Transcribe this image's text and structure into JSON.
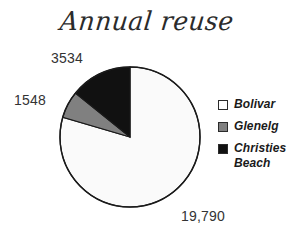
{
  "chart_data": {
    "type": "pie",
    "title": "Annual reuse",
    "xlabel": "",
    "ylabel": "",
    "legend_position": "right",
    "grid": false,
    "total": 24872,
    "categories": [
      "Bolivar",
      "Glenelg",
      "Christies Beach"
    ],
    "values": [
      19790,
      1548,
      3534
    ],
    "value_labels": [
      "19,790",
      "1548",
      "3534"
    ],
    "colors": [
      "#fafafa",
      "#808080",
      "#111111"
    ],
    "percentages": [
      79.6,
      6.2,
      14.2
    ],
    "slices": [
      {
        "name": "Bolivar",
        "value": 19790,
        "label": "19,790",
        "percent": 79.6,
        "color": "#fafafa",
        "start_angle": 0,
        "end_angle": 286.4
      },
      {
        "name": "Glenelg",
        "value": 1548,
        "label": "1548",
        "percent": 6.2,
        "color": "#808080",
        "start_angle": 286.4,
        "end_angle": 308.8
      },
      {
        "name": "Christies Beach",
        "value": 3534,
        "label": "3534",
        "percent": 14.2,
        "color": "#111111",
        "start_angle": 308.8,
        "end_angle": 360
      }
    ]
  },
  "title": {
    "text": "Annual reuse"
  },
  "labels": {
    "christies_beach": "3534",
    "glenelg": "1548",
    "bolivar": "19,790"
  },
  "legend": {
    "items": [
      {
        "label": "Bolivar",
        "color": "#ffffff"
      },
      {
        "label": "Glenelg",
        "color": "#808080"
      },
      {
        "label": "Christies",
        "label2": "Beach",
        "color": "#111111"
      }
    ]
  },
  "style": {
    "background": "#ffffff",
    "outline": "#1a1a1a",
    "text": "#333333"
  }
}
